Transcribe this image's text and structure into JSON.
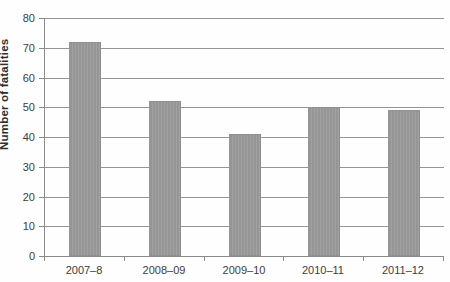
{
  "chart_data": {
    "type": "bar",
    "categories": [
      "2007–8",
      "2008–09",
      "2009–10",
      "2010–11",
      "2011–12"
    ],
    "values": [
      72,
      52,
      41,
      50,
      49
    ],
    "title": "",
    "xlabel": "",
    "ylabel": "Number of fatalities",
    "ylim": [
      0,
      80
    ],
    "ytick_step": 10,
    "grid": true,
    "legend_position": "none",
    "colors": {
      "bar": "#9b9b9b",
      "gridline": "#949494",
      "axis": "#8a8a8a",
      "tick_text": "#3d3d3d",
      "axis_title_text": "#2e2e2e",
      "background": "#fefefe"
    }
  }
}
